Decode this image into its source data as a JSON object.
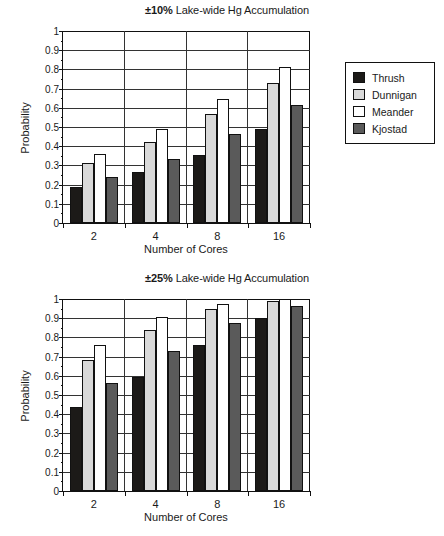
{
  "legend": {
    "position": "right",
    "entries": [
      {
        "label": "Thrush",
        "color": "#1c1a18",
        "swatch": "legend-swatch-thrush"
      },
      {
        "label": "Dunnigan",
        "color": "#d9d9d9",
        "swatch": "legend-swatch-dunnigan"
      },
      {
        "label": "Meander",
        "color": "#ffffff",
        "swatch": "legend-swatch-meander"
      },
      {
        "label": "Kjostad",
        "color": "#5a5a5a",
        "swatch": "legend-swatch-kjostad"
      }
    ]
  },
  "charts": [
    {
      "id": "chart-top",
      "title_prefix": "±10%",
      "title_rest": " Lake-wide Hg Accumulation"
    },
    {
      "id": "chart-bottom",
      "title_prefix": "±25%",
      "title_rest": " Lake-wide Hg Accumulation"
    }
  ],
  "chart_data": [
    {
      "type": "bar",
      "title": "±10% Lake-wide Hg Accumulation",
      "xlabel": "Number of Cores",
      "ylabel": "Probability",
      "categories": [
        "2",
        "4",
        "8",
        "16"
      ],
      "ylim": [
        0,
        1
      ],
      "yticks": [
        0,
        0.1,
        0.2,
        0.3,
        0.4,
        0.5,
        0.6,
        0.7,
        0.8,
        0.9,
        1
      ],
      "ytick_labels": [
        "0",
        "0.1",
        "0.2",
        "0.3",
        "0.4",
        "0.5",
        "0.6",
        "0.7",
        "0.8",
        "0.9",
        "1"
      ],
      "grid": true,
      "legend_position": "right",
      "series": [
        {
          "name": "Thrush",
          "color": "#1c1a18",
          "values": [
            0.19,
            0.265,
            0.355,
            0.49
          ]
        },
        {
          "name": "Dunnigan",
          "color": "#d9d9d9",
          "values": [
            0.31,
            0.42,
            0.57,
            0.73
          ]
        },
        {
          "name": "Meander",
          "color": "#ffffff",
          "values": [
            0.36,
            0.49,
            0.645,
            0.81
          ]
        },
        {
          "name": "Kjostad",
          "color": "#5a5a5a",
          "values": [
            0.24,
            0.335,
            0.465,
            0.615
          ]
        }
      ]
    },
    {
      "type": "bar",
      "title": "±25% Lake-wide Hg Accumulation",
      "xlabel": "Number of Cores",
      "ylabel": "Probability",
      "categories": [
        "2",
        "4",
        "8",
        "16"
      ],
      "ylim": [
        0,
        1
      ],
      "yticks": [
        0,
        0.1,
        0.2,
        0.3,
        0.4,
        0.5,
        0.6,
        0.7,
        0.8,
        0.9,
        1
      ],
      "ytick_labels": [
        "0",
        "0.1",
        "0.2",
        "0.3",
        "0.4",
        "0.5",
        "0.6",
        "0.7",
        "0.8",
        "0.9",
        "1"
      ],
      "grid": true,
      "legend_position": "right",
      "series": [
        {
          "name": "Thrush",
          "color": "#1c1a18",
          "values": [
            0.44,
            0.595,
            0.76,
            0.9
          ]
        },
        {
          "name": "Dunnigan",
          "color": "#d9d9d9",
          "values": [
            0.68,
            0.84,
            0.95,
            0.99
          ]
        },
        {
          "name": "Meander",
          "color": "#ffffff",
          "values": [
            0.76,
            0.905,
            0.975,
            1.0
          ]
        },
        {
          "name": "Kjostad",
          "color": "#5a5a5a",
          "values": [
            0.565,
            0.73,
            0.875,
            0.965
          ]
        }
      ]
    }
  ]
}
